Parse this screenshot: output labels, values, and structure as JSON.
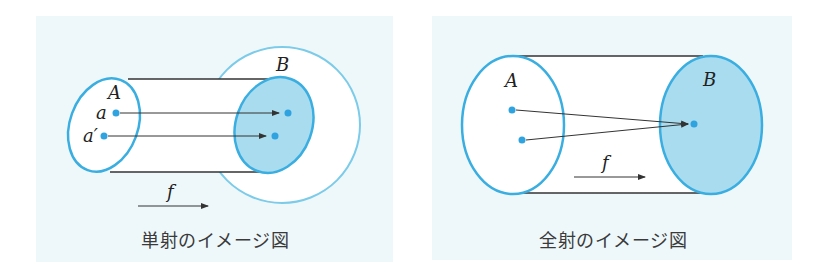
{
  "colors": {
    "panel_bg": "#eef8fb",
    "set_outline": "#3aaee0",
    "outer_circle": "#7ccbe8",
    "fill_blue": "#a9dcef",
    "point": "#2ea3e0",
    "line": "#333333"
  },
  "left_diagram": {
    "title": "単射のイメージ図",
    "set_a_label": "A",
    "set_b_label": "B",
    "element_a_label": "a",
    "element_a_prime_label": "a′",
    "map_label": "f"
  },
  "right_diagram": {
    "title": "全射のイメージ図",
    "set_a_label": "A",
    "set_b_label": "B",
    "map_label": "f"
  }
}
